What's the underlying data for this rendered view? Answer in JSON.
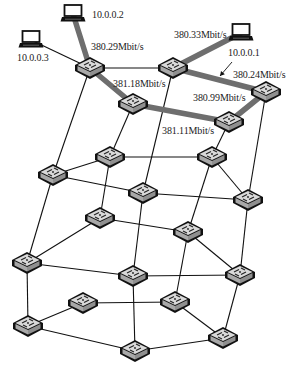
{
  "hosts": [
    {
      "id": "h2",
      "ip": "10.0.0.2",
      "x": 73,
      "y": 14,
      "label_x": 92,
      "label_y": 10
    },
    {
      "id": "h3",
      "ip": "10.0.0.3",
      "x": 31,
      "y": 40,
      "label_x": 17,
      "label_y": 53
    },
    {
      "id": "h1",
      "ip": "10.0.0.1",
      "x": 241,
      "y": 33,
      "label_x": 228,
      "label_y": 48
    }
  ],
  "switches": [
    {
      "id": "s1",
      "x": 90,
      "y": 68
    },
    {
      "id": "s2",
      "x": 173,
      "y": 68
    },
    {
      "id": "s3",
      "x": 133,
      "y": 104
    },
    {
      "id": "s4",
      "x": 266,
      "y": 92
    },
    {
      "id": "s5",
      "x": 229,
      "y": 122
    },
    {
      "id": "s6",
      "x": 53,
      "y": 175
    },
    {
      "id": "s7",
      "x": 110,
      "y": 157
    },
    {
      "id": "s8",
      "x": 143,
      "y": 193
    },
    {
      "id": "s9",
      "x": 212,
      "y": 157
    },
    {
      "id": "s10",
      "x": 248,
      "y": 200
    },
    {
      "id": "s11",
      "x": 100,
      "y": 218
    },
    {
      "id": "s12",
      "x": 188,
      "y": 232
    },
    {
      "id": "s13",
      "x": 27,
      "y": 263
    },
    {
      "id": "s14",
      "x": 133,
      "y": 276
    },
    {
      "id": "s15",
      "x": 240,
      "y": 275
    },
    {
      "id": "s16",
      "x": 83,
      "y": 303
    },
    {
      "id": "s17",
      "x": 175,
      "y": 302
    },
    {
      "id": "s18",
      "x": 28,
      "y": 326
    },
    {
      "id": "s19",
      "x": 135,
      "y": 351
    },
    {
      "id": "s20",
      "x": 223,
      "y": 338
    }
  ],
  "thick_links": [
    {
      "from": "h2",
      "to": "s1"
    },
    {
      "from": "s1",
      "to": "s3"
    },
    {
      "from": "s3",
      "to": "s5"
    },
    {
      "from": "s5",
      "to": "s4"
    },
    {
      "from": "s4",
      "to": "s2"
    },
    {
      "from": "s2",
      "to": "h1"
    }
  ],
  "thin_links": [
    {
      "from": "h3",
      "to": "s1"
    },
    {
      "from": "s1",
      "to": "s2"
    },
    {
      "from": "s1",
      "to": "s6"
    },
    {
      "from": "s3",
      "to": "s7"
    },
    {
      "from": "s2",
      "to": "s8"
    },
    {
      "from": "s5",
      "to": "s9"
    },
    {
      "from": "s4",
      "to": "s10"
    },
    {
      "from": "s6",
      "to": "s7"
    },
    {
      "from": "s6",
      "to": "s8"
    },
    {
      "from": "s7",
      "to": "s9"
    },
    {
      "from": "s7",
      "to": "s11"
    },
    {
      "from": "s8",
      "to": "s10"
    },
    {
      "from": "s9",
      "to": "s10"
    },
    {
      "from": "s9",
      "to": "s12"
    },
    {
      "from": "s8",
      "to": "s14"
    },
    {
      "from": "s6",
      "to": "s13"
    },
    {
      "from": "s10",
      "to": "s15"
    },
    {
      "from": "s11",
      "to": "s13"
    },
    {
      "from": "s11",
      "to": "s12"
    },
    {
      "from": "s12",
      "to": "s15"
    },
    {
      "from": "s13",
      "to": "s14"
    },
    {
      "from": "s14",
      "to": "s15"
    },
    {
      "from": "s12",
      "to": "s17"
    },
    {
      "from": "s13",
      "to": "s18"
    },
    {
      "from": "s14",
      "to": "s19"
    },
    {
      "from": "s15",
      "to": "s20"
    },
    {
      "from": "s16",
      "to": "s18"
    },
    {
      "from": "s16",
      "to": "s17"
    },
    {
      "from": "s17",
      "to": "s20"
    },
    {
      "from": "s18",
      "to": "s19"
    },
    {
      "from": "s19",
      "to": "s20"
    }
  ],
  "bandwidth_labels": [
    {
      "text": "380.29Mbit/s",
      "x": 91,
      "y": 42
    },
    {
      "text": "381.18Mbit/s",
      "x": 113,
      "y": 79
    },
    {
      "text": "380.33Mbit/s",
      "x": 174,
      "y": 30
    },
    {
      "text": "380.24Mbit/s",
      "x": 233,
      "y": 70
    },
    {
      "text": "380.99Mbit/s",
      "x": 193,
      "y": 93
    },
    {
      "text": "381.11Mbit/s",
      "x": 162,
      "y": 126
    }
  ],
  "arrow": {
    "from_x": 232,
    "from_y": 62,
    "to_x": 220,
    "to_y": 76
  },
  "colors": {
    "thick_link": "#6e6e6e",
    "thin_link": "#111111",
    "switch_top": "#d9d9d9",
    "switch_side": "#a8a8a8",
    "switch_outline": "#111111",
    "text": "#222222"
  }
}
